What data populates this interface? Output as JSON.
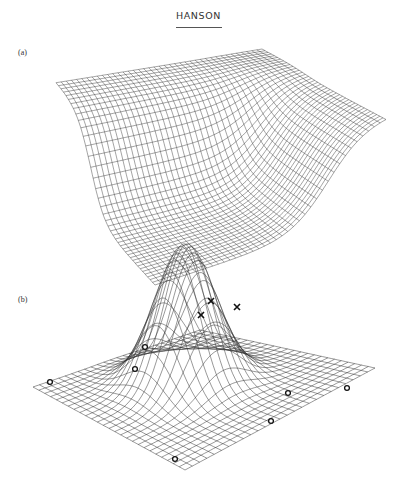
{
  "header": {
    "title": "HANSON"
  },
  "figure": {
    "panels": [
      {
        "label": "(a)",
        "description": "3D wireframe mesh of a surface: a high flat plateau at the back that drops steeply into a deep valley toward the front",
        "grid_lines": 40,
        "corners": {
          "left": [
            56,
            82
          ],
          "back": [
            262,
            49
          ],
          "right": [
            386,
            115
          ],
          "front": [
            155,
            190
          ]
        },
        "drop_depth": 95
      },
      {
        "label": "(b)",
        "description": "3D wireframe mesh of a Gaussian-like bump on a flat plane, with sample points marked",
        "grid_lines": 26,
        "corners": {
          "left": [
            33,
            387
          ],
          "back": [
            200,
            330
          ],
          "right": [
            375,
            368
          ],
          "front": [
            185,
            470
          ]
        },
        "peak_height": 140,
        "markers": {
          "crosses": [
            [
              211,
              301
            ],
            [
              201,
              315
            ],
            [
              237,
              307
            ]
          ],
          "circles": [
            [
              145,
              347
            ],
            [
              135,
              369
            ],
            [
              50,
              382
            ],
            [
              288,
              393
            ],
            [
              347,
              388
            ],
            [
              271,
              421
            ],
            [
              175,
              459
            ]
          ]
        }
      }
    ]
  },
  "colors": {
    "mesh": "#333333",
    "background": "#ffffff"
  }
}
